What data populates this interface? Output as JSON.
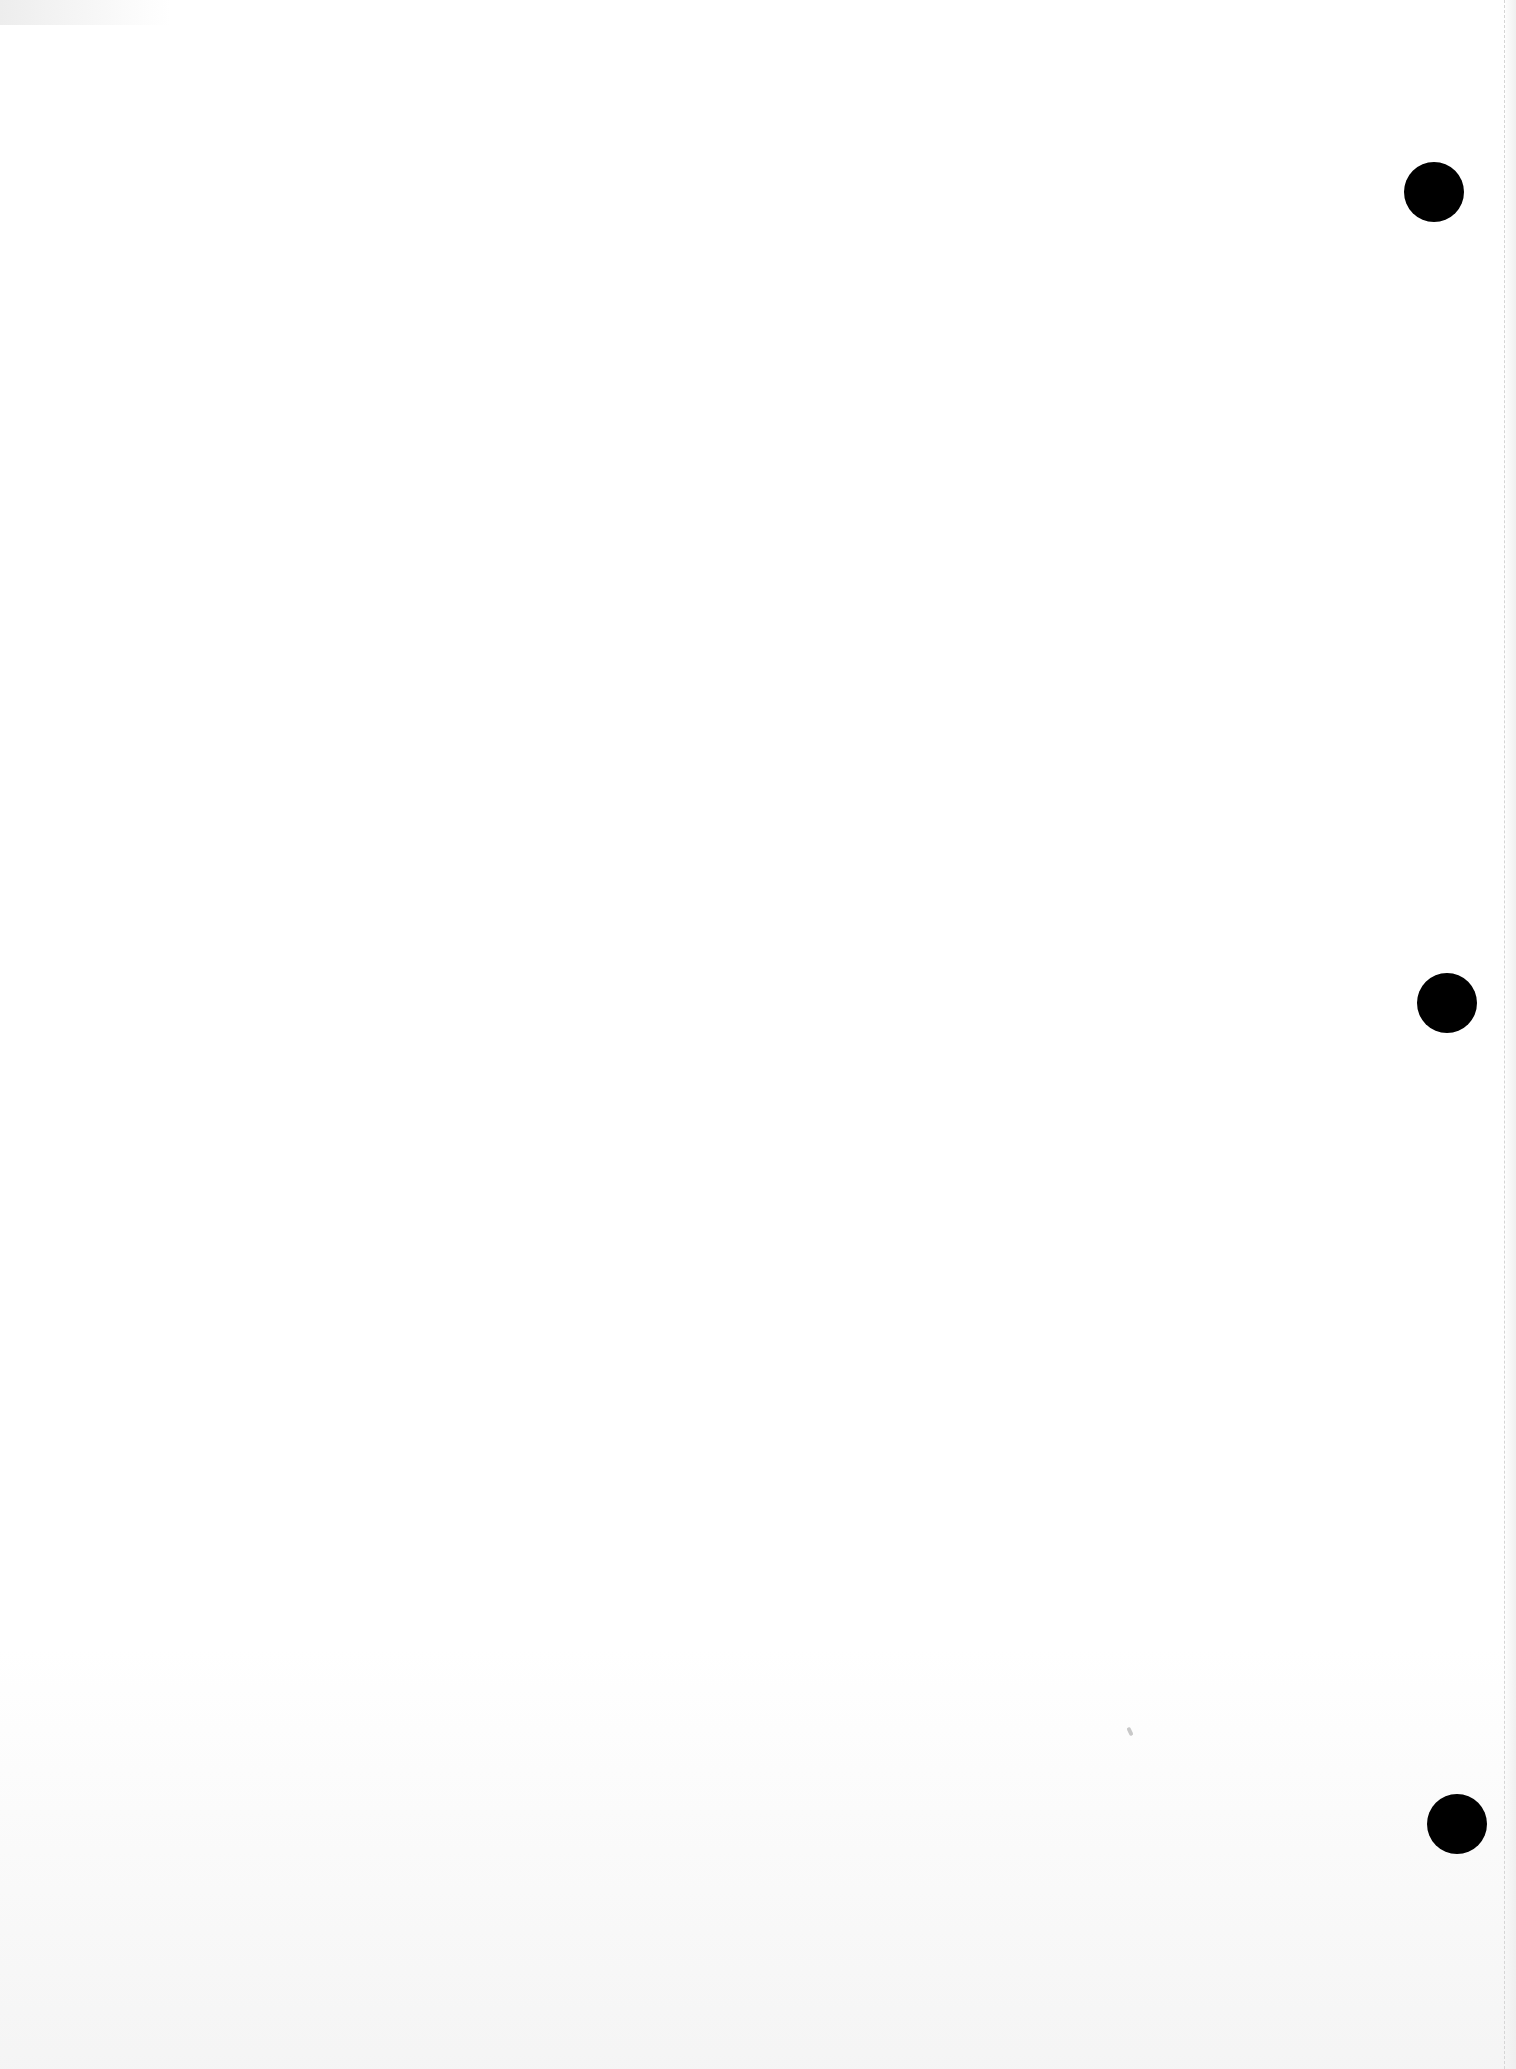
{
  "page": {
    "width": 1516,
    "height": 2069,
    "background": "#ffffff"
  },
  "punch_holes": [
    {
      "cx": 1434,
      "cy": 192,
      "r": 30,
      "color": "#000000"
    },
    {
      "cx": 1447,
      "cy": 1003,
      "r": 30,
      "color": "#000000"
    },
    {
      "cx": 1457,
      "cy": 1824,
      "r": 30,
      "color": "#000000"
    }
  ],
  "margin_line": {
    "x": 1504,
    "color": "#d6d6d6"
  },
  "specks": [
    {
      "x": 1128,
      "y": 1727
    }
  ]
}
